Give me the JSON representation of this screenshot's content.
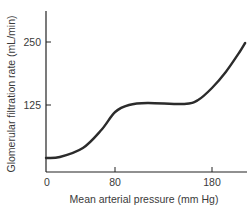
{
  "chart_data": {
    "type": "line",
    "title": "",
    "xlabel": "Mean arterial pressure (mm Hg)",
    "ylabel": "Glomerular filtration rate (mL/min)",
    "xlim": [
      0,
      220
    ],
    "ylim": [
      0,
      300
    ],
    "x_ticks": [
      0,
      80,
      180
    ],
    "y_ticks": [
      125,
      250
    ],
    "grid": false,
    "legend": null,
    "series": [
      {
        "name": "GFR",
        "x": [
          0,
          15,
          40,
          60,
          75,
          90,
          110,
          150,
          165,
          180,
          195,
          210,
          216
        ],
        "y": [
          20,
          22,
          40,
          76,
          112,
          126,
          130,
          128,
          136,
          160,
          192,
          232,
          250
        ]
      }
    ],
    "colors": {
      "line": "#2b2b2b",
      "axis": "#222222"
    }
  }
}
